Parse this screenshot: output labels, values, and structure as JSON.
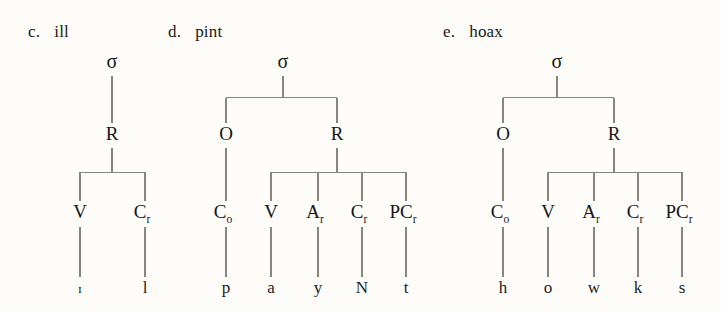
{
  "figure": {
    "background_color": "#fdfcf9",
    "line_color": "#86867e",
    "text_color": "#17171a",
    "width": 721,
    "height": 311,
    "caption_font_size": 17
  },
  "node_glyphs": {
    "sigma": "σ",
    "onset": "O",
    "rhyme": "R",
    "vowel": "V",
    "coda_r": "C",
    "appendix_r": "A",
    "pre_coda_r": "PC",
    "onset_consonant": "C",
    "sub_r": "r",
    "sub_o": "o"
  },
  "trees": [
    {
      "id": "ill",
      "item_letter": "c.",
      "word": "ill",
      "label_x": 28,
      "label_y": 22,
      "root": "σ",
      "root_x": 112,
      "levels": {
        "root_y": 68,
        "level1_y": 140,
        "level2_y": 218,
        "terminal_y": 293
      },
      "level1": [
        {
          "label": "R",
          "sub": "",
          "x": 112
        }
      ],
      "level2": [
        {
          "label": "V",
          "sub": "",
          "x": 80,
          "terminal": "ɪ",
          "terminal_style": "ipa-smallcap"
        },
        {
          "label": "C",
          "sub": "r",
          "x": 145,
          "terminal": "l",
          "terminal_style": "normal"
        }
      ],
      "terminals": [
        "ɪ",
        "l"
      ],
      "node_labels": [
        "σ",
        "R",
        "V",
        "Cᵣ"
      ]
    },
    {
      "id": "pint",
      "item_letter": "d.",
      "word": "pint",
      "label_x": 168,
      "label_y": 22,
      "root": "σ",
      "root_x": 283,
      "levels": {
        "root_y": 68,
        "level1_y": 140,
        "level2_y": 218,
        "terminal_y": 293
      },
      "level1": [
        {
          "label": "O",
          "sub": "",
          "x": 226
        },
        {
          "label": "R",
          "sub": "",
          "x": 337
        }
      ],
      "level2": [
        {
          "label": "C",
          "sub": "o",
          "x": 226,
          "terminal": "p",
          "terminal_style": "normal"
        },
        {
          "label": "V",
          "sub": "",
          "x": 271,
          "terminal": "a",
          "terminal_style": "normal"
        },
        {
          "label": "A",
          "sub": "r",
          "x": 318,
          "terminal": "y",
          "terminal_style": "normal"
        },
        {
          "label": "C",
          "sub": "r",
          "x": 362,
          "terminal": "N",
          "terminal_style": "normal"
        },
        {
          "label": "PC",
          "sub": "r",
          "x": 406,
          "terminal": "t",
          "terminal_style": "normal"
        }
      ],
      "terminals": [
        "p",
        "a",
        "y",
        "N",
        "t"
      ],
      "node_labels": [
        "σ",
        "O",
        "R",
        "Cₒ",
        "V",
        "Aᵣ",
        "Cᵣ",
        "PCᵣ"
      ]
    },
    {
      "id": "hoax",
      "item_letter": "e.",
      "word": "hoax",
      "label_x": 443,
      "label_y": 22,
      "root": "σ",
      "root_x": 557,
      "levels": {
        "root_y": 68,
        "level1_y": 140,
        "level2_y": 218,
        "terminal_y": 293
      },
      "level1": [
        {
          "label": "O",
          "sub": "",
          "x": 503
        },
        {
          "label": "R",
          "sub": "",
          "x": 614
        }
      ],
      "level2": [
        {
          "label": "C",
          "sub": "o",
          "x": 503,
          "terminal": "h",
          "terminal_style": "normal"
        },
        {
          "label": "V",
          "sub": "",
          "x": 548,
          "terminal": "o",
          "terminal_style": "normal"
        },
        {
          "label": "A",
          "sub": "r",
          "x": 594,
          "terminal": "w",
          "terminal_style": "normal"
        },
        {
          "label": "C",
          "sub": "r",
          "x": 638,
          "terminal": "k",
          "terminal_style": "normal"
        },
        {
          "label": "PC",
          "sub": "r",
          "x": 682,
          "terminal": "s",
          "terminal_style": "normal"
        }
      ],
      "terminals": [
        "h",
        "o",
        "w",
        "k",
        "s"
      ],
      "node_labels": [
        "σ",
        "O",
        "R",
        "Cₒ",
        "V",
        "Aᵣ",
        "Cᵣ",
        "PCᵣ"
      ]
    }
  ]
}
